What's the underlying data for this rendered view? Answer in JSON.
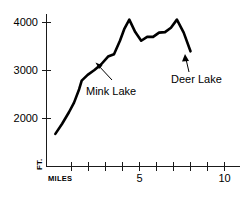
{
  "chart_data": {
    "type": "line",
    "title": "",
    "subtitle": "",
    "xlabel": "MILES",
    "ylabel": "FT.",
    "xlim": [
      0,
      10
    ],
    "ylim": [
      1000,
      4300
    ],
    "grid": false,
    "legend": "none",
    "x_ticks": [
      1,
      2,
      3,
      4,
      5,
      6,
      7,
      8,
      9,
      10
    ],
    "x_tick_labels": [
      "MILES",
      "",
      "",
      "",
      "5",
      "",
      "",
      "",
      "",
      "10"
    ],
    "y_ticks": [
      2000,
      3000,
      4000
    ],
    "y_tick_labels": [
      "2000",
      "3000",
      "4000"
    ],
    "series_name": "Elevation profile",
    "x": [
      0.05,
      0.45,
      0.85,
      1.15,
      1.45,
      1.6,
      1.95,
      2.35,
      2.75,
      3.15,
      3.5,
      3.85,
      4.1,
      4.4,
      4.75,
      5.1,
      5.45,
      5.8,
      6.15,
      6.5,
      6.85,
      7.2,
      7.6,
      8.0
    ],
    "y": [
      1680,
      1890,
      2130,
      2330,
      2610,
      2790,
      2910,
      3010,
      3130,
      3290,
      3340,
      3620,
      3860,
      4060,
      3800,
      3620,
      3700,
      3700,
      3790,
      3800,
      3890,
      4060,
      3790,
      3400
    ],
    "annotations": [
      {
        "text": "Mink Lake",
        "points_to_x": 3.05,
        "points_to_y": 3150,
        "label_x": 3.5,
        "label_y": 2440
      },
      {
        "text": "Deer Lake",
        "points_to_x": 7.75,
        "points_to_y": 3560,
        "label_x": 8.1,
        "label_y": 3010
      }
    ]
  },
  "axis": {
    "y_unit": "FT.",
    "x_unit": "MILES",
    "y_label_2000": "2000",
    "y_label_3000": "3000",
    "y_label_4000": "4000",
    "x_label_5": "5",
    "x_label_10": "10"
  },
  "annotations": {
    "mink_lake": "Mink Lake",
    "deer_lake": "Deer Lake"
  },
  "colors": {
    "line": "#000000",
    "axis": "#1a1a1a",
    "background": "#ffffff",
    "text": "#000000"
  }
}
